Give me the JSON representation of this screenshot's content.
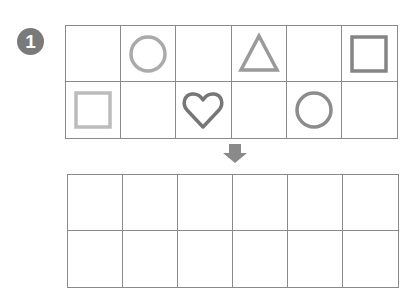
{
  "problem": {
    "number": "1",
    "badge_color": "#7a7a7a"
  },
  "top_grid": {
    "rows": 2,
    "cols": 6,
    "cells": [
      [
        {
          "shape": "empty",
          "color": ""
        },
        {
          "shape": "circle",
          "color": "#aaaaaa"
        },
        {
          "shape": "empty",
          "color": ""
        },
        {
          "shape": "triangle",
          "color": "#9a9a9a"
        },
        {
          "shape": "empty",
          "color": ""
        },
        {
          "shape": "square",
          "color": "#858585"
        }
      ],
      [
        {
          "shape": "square",
          "color": "#bcbcbc"
        },
        {
          "shape": "empty",
          "color": ""
        },
        {
          "shape": "heart",
          "color": "#767676"
        },
        {
          "shape": "empty",
          "color": ""
        },
        {
          "shape": "circle",
          "color": "#8c8c8c"
        },
        {
          "shape": "empty",
          "color": ""
        }
      ]
    ]
  },
  "arrow": {
    "icon": "down-arrow-icon",
    "color": "#8a8a8a"
  },
  "bottom_grid": {
    "rows": 2,
    "cols": 6,
    "cells": [
      [
        {},
        {},
        {},
        {},
        {},
        {}
      ],
      [
        {},
        {},
        {},
        {},
        {},
        {}
      ]
    ]
  }
}
